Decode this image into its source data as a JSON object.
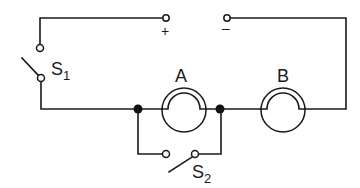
{
  "diagram": {
    "type": "circuit",
    "terminals": {
      "positive": "+",
      "negative": "–"
    },
    "switches": [
      {
        "id": "S1",
        "letter": "S",
        "subscript": "1"
      },
      {
        "id": "S2",
        "letter": "S",
        "subscript": "2"
      }
    ],
    "lamps": [
      {
        "id": "A",
        "label": "A"
      },
      {
        "id": "B",
        "label": "B"
      }
    ],
    "colors": {
      "line": "#1a1a1a",
      "background": "#ffffff"
    }
  }
}
